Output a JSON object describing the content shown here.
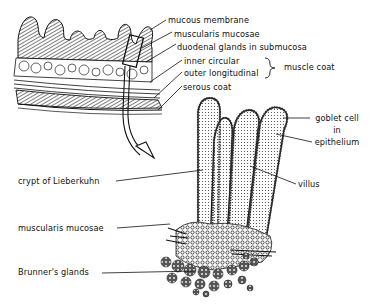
{
  "diagram": {
    "labels_upper": {
      "mucous_membrane": "mucous membrane",
      "muscularis_mucosae": "muscularis mucosae",
      "duodenal_glands": "duodenal glands in submucosa",
      "inner_circular": "inner circular",
      "outer_longitudinal": "outer longitudinal",
      "muscle_coat": "muscle coat",
      "serous_coat": "serous coat"
    },
    "labels_detail": {
      "goblet_cell_1": "goblet cell",
      "goblet_cell_2": "in",
      "goblet_cell_3": "epithelium",
      "villus": "villus",
      "crypt": "crypt of Lieberkuhn",
      "muscularis_mucosae": "muscularis mucosae",
      "brunners_glands": "Brunner's glands"
    },
    "colors": {
      "ink": "#111111",
      "background": "#ffffff"
    }
  }
}
